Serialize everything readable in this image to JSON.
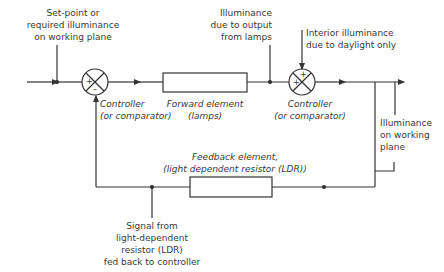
{
  "diagram": {
    "labels": {
      "setpoint": "Set-point or\nrequired illuminance\non working plane",
      "lamp_illuminance": "Illuminance\ndue to output\nfrom lamps",
      "daylight": "Interior illuminance\ndue to daylight only",
      "controller1": "Controller\n(or comparator)",
      "forward_element": "Forward element\n(lamps)",
      "controller2": "Controller\n(or comparator)",
      "working_plane": "Illuminance\non working\nplane",
      "feedback_element": "Feedback element,\n(light dependent resistor (LDR))",
      "signal": "Signal from\nlight-dependent\nresistor (LDR)\nfed back to controller"
    },
    "signs": {
      "c1_plus": "+",
      "c1_minus": "–",
      "c2_plus_top": "+",
      "c2_plus_left": "+"
    },
    "colors": {
      "line": "#333333",
      "text": "#3a3a3a"
    }
  }
}
